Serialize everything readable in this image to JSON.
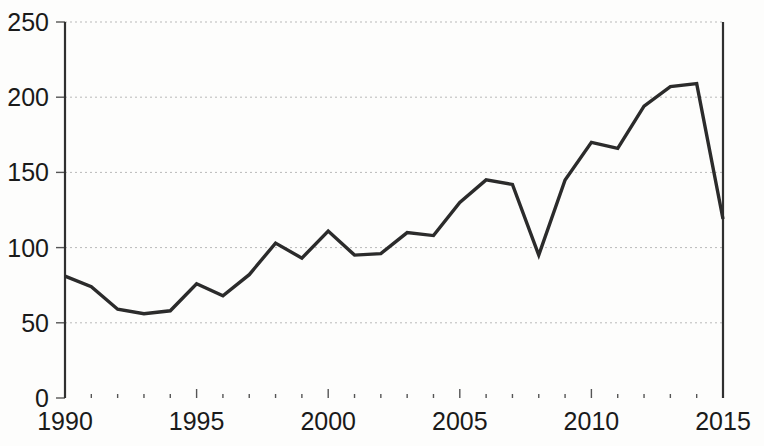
{
  "chart_data": {
    "type": "line",
    "title": "",
    "subtitle": "",
    "xlabel": "",
    "ylabel": "",
    "xlim": [
      1990,
      2015
    ],
    "ylim": [
      0,
      250
    ],
    "grid": true,
    "legend": false,
    "legend_position": "none",
    "line_color": "#2b2b2b",
    "grid_color": "#b9b9b9",
    "axis_color": "#303030",
    "background_color": "#fdfdfc",
    "y_ticks": [
      0,
      50,
      100,
      150,
      200,
      250
    ],
    "y_tick_labels": [
      "0",
      "50",
      "100",
      "150",
      "200",
      "250"
    ],
    "x_ticks": [
      1990,
      1995,
      2000,
      2005,
      2010,
      2015
    ],
    "x_tick_labels": [
      "1990",
      "1995",
      "2000",
      "2005",
      "2010",
      "2015"
    ],
    "x_minor_ticks": [
      1991,
      1992,
      1993,
      1994,
      1996,
      1997,
      1998,
      1999,
      2001,
      2002,
      2003,
      2004,
      2006,
      2007,
      2008,
      2009,
      2011,
      2012,
      2013,
      2014
    ],
    "x": [
      1990,
      1991,
      1992,
      1993,
      1994,
      1995,
      1996,
      1997,
      1998,
      1999,
      2000,
      2001,
      2002,
      2003,
      2004,
      2005,
      2006,
      2007,
      2008,
      2009,
      2010,
      2011,
      2012,
      2013,
      2014,
      2015
    ],
    "values": [
      81,
      74,
      59,
      56,
      58,
      76,
      68,
      82,
      103,
      93,
      111,
      95,
      96,
      110,
      108,
      130,
      145,
      142,
      95,
      145,
      170,
      166,
      194,
      207,
      209,
      119
    ],
    "series": [
      {
        "name": "series-1",
        "values": [
          81,
          74,
          59,
          56,
          58,
          76,
          68,
          82,
          103,
          93,
          111,
          95,
          96,
          110,
          108,
          130,
          145,
          142,
          95,
          145,
          170,
          166,
          194,
          207,
          209,
          119
        ]
      }
    ]
  }
}
